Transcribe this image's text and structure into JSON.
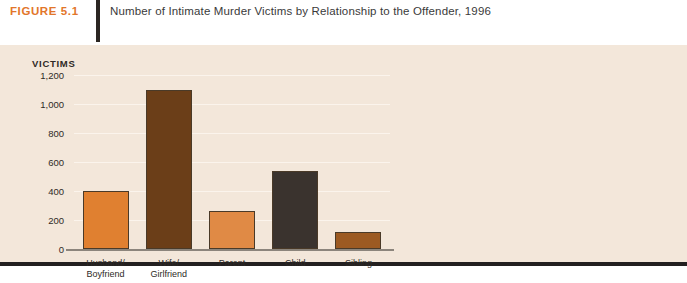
{
  "header": {
    "figure_number": "FIGURE 5.1",
    "title": "Number of Intimate Murder Victims by Relationship to the Offender, 1996"
  },
  "colors": {
    "figure_number": "#E2762A",
    "panel_background": "#F3E7DA",
    "panel_border": "#232020",
    "divider": "#2B2622",
    "baseline": "#8C857C",
    "gridline": "#FBF4EC",
    "bar_outline": "#4A3A28"
  },
  "chart_data": {
    "type": "bar",
    "title": "Number of Intimate Murder Victims by Relationship to the Offender, 1996",
    "xlabel": "",
    "ylabel": "VICTIMS",
    "ylim": [
      0,
      1200
    ],
    "ytick_labels": [
      "1,200",
      "1,000",
      "800",
      "600",
      "400",
      "200",
      "0"
    ],
    "ytick_values": [
      1200,
      1000,
      800,
      600,
      400,
      200,
      0
    ],
    "grid": true,
    "legend": "none",
    "categories": [
      "Husband/\nBoyfriend",
      "Wife/\nGirlfriend",
      "Parent",
      "Child",
      "Sibling"
    ],
    "values": [
      400,
      1100,
      260,
      540,
      120
    ],
    "bar_colors": [
      "#E08030",
      "#6B3E18",
      "#E08A45",
      "#3A332E",
      "#9C5A22"
    ]
  }
}
